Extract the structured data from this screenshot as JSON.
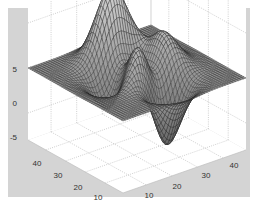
{
  "figure": {
    "background_color": "#ffffff",
    "axes_background_color": "#d4d4d4",
    "pane_color": "#ffffff",
    "grid_color": "#b0b0b0",
    "mesh_color": "#222222",
    "surface_fill": "#8a8a8a"
  },
  "chart_data": {
    "type": "surface",
    "title": "",
    "xlabel": "",
    "ylabel": "",
    "zlabel": "",
    "function": "peaks-like 3D mesh on 49x49 grid",
    "x_ticks": [
      "10",
      "20",
      "30",
      "40"
    ],
    "y_ticks": [
      "10",
      "20",
      "30",
      "40"
    ],
    "z_ticks": [
      "-5",
      "0",
      "5"
    ],
    "xlim": [
      1,
      49
    ],
    "ylim": [
      1,
      49
    ],
    "zlim": [
      -8,
      8
    ],
    "grid": true,
    "grid_size": 49,
    "features": [
      {
        "type": "peak",
        "x": 30,
        "y": 35,
        "z": 5
      },
      {
        "type": "peak",
        "x": 22,
        "y": 28,
        "z": 3
      },
      {
        "type": "valley",
        "x": 26,
        "y": 18,
        "z": -6
      },
      {
        "type": "valley",
        "x": 15,
        "y": 30,
        "z": -2
      }
    ]
  }
}
